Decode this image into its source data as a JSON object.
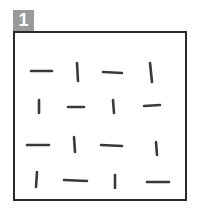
{
  "badge": {
    "label": "1",
    "color": "#9a9a9a",
    "text_color": "#ffffff"
  },
  "frame": {
    "border_color": "#2a2a2a"
  },
  "stroke_color": "#3a3a3a",
  "grid": {
    "rows": 4,
    "cols": 4,
    "orientations": [
      [
        "horizontal",
        "vertical",
        "horizontal",
        "vertical"
      ],
      [
        "vertical",
        "horizontal",
        "vertical",
        "horizontal"
      ],
      [
        "horizontal",
        "vertical",
        "horizontal",
        "vertical"
      ],
      [
        "vertical",
        "horizontal",
        "vertical",
        "horizontal"
      ]
    ]
  },
  "marks": [
    {
      "x1": 31,
      "y1": 71,
      "x2": 52,
      "y2": 71
    },
    {
      "x1": 77,
      "y1": 63,
      "x2": 78,
      "y2": 81
    },
    {
      "x1": 103,
      "y1": 72,
      "x2": 122,
      "y2": 73
    },
    {
      "x1": 150,
      "y1": 63,
      "x2": 152,
      "y2": 82
    },
    {
      "x1": 39,
      "y1": 100,
      "x2": 39,
      "y2": 113
    },
    {
      "x1": 68,
      "y1": 107,
      "x2": 84,
      "y2": 107
    },
    {
      "x1": 113,
      "y1": 100,
      "x2": 114,
      "y2": 113
    },
    {
      "x1": 144,
      "y1": 106,
      "x2": 160,
      "y2": 105
    },
    {
      "x1": 27,
      "y1": 145,
      "x2": 49,
      "y2": 145
    },
    {
      "x1": 74,
      "y1": 137,
      "x2": 75,
      "y2": 152
    },
    {
      "x1": 101,
      "y1": 145,
      "x2": 122,
      "y2": 146
    },
    {
      "x1": 156,
      "y1": 142,
      "x2": 157,
      "y2": 155
    },
    {
      "x1": 37,
      "y1": 172,
      "x2": 36,
      "y2": 187
    },
    {
      "x1": 64,
      "y1": 180,
      "x2": 87,
      "y2": 181
    },
    {
      "x1": 115,
      "y1": 175,
      "x2": 115,
      "y2": 188
    },
    {
      "x1": 147,
      "y1": 182,
      "x2": 169,
      "y2": 182
    }
  ]
}
